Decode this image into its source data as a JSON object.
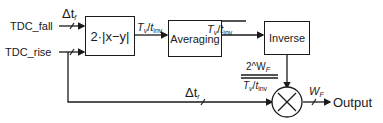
{
  "inputs": {
    "fall": "TDC_fall",
    "rise": "TDC_rise"
  },
  "signals": {
    "delta_tf": {
      "base": "Δt",
      "sub": "f"
    },
    "delta_tr": {
      "base": "Δt",
      "sub": "r"
    },
    "tv_tinv": {
      "num": "T",
      "num_sub": "v",
      "den": "t",
      "den_sub": "inv"
    },
    "tv_tinv_avg": {
      "num": "T",
      "num_sub": "v",
      "den": "t",
      "den_sub": "inv",
      "overline": true
    },
    "fraction": {
      "numerator": "2^W",
      "numerator_sub": "F",
      "denominator": "T",
      "denominator_sub_v": "v",
      "denominator_t": "t",
      "denominator_sub_inv": "inv"
    },
    "wf": {
      "base": "W",
      "sub": "F"
    }
  },
  "blocks": {
    "absdiff": "2·|x−y|",
    "averaging": "Averaging",
    "inverse": "Inverse",
    "multiplier": "×"
  },
  "output": "Output"
}
